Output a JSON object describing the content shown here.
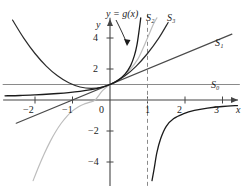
{
  "figure": {
    "name": "taylor-polynomial-approximations-graph",
    "background": "#ffffff",
    "width": 247,
    "height": 186
  },
  "axes": {
    "x_label": "x",
    "y_label": "y",
    "x_ticks": [
      {
        "value": -2,
        "label": "−2"
      },
      {
        "value": -1,
        "label": "−1"
      },
      {
        "value": 1,
        "label": "1"
      },
      {
        "value": 2,
        "label": "2"
      },
      {
        "value": 3,
        "label": "3"
      }
    ],
    "y_ticks": [
      {
        "value": 4,
        "label": "4"
      },
      {
        "value": 2,
        "label": "2"
      },
      {
        "value": -2,
        "label": "−2"
      },
      {
        "value": -4,
        "label": "−4"
      }
    ],
    "origin_label": "0",
    "xlim": [
      -2.85,
      3.55
    ],
    "ylim": [
      -5.2,
      5.3
    ],
    "axis_color": "#444444",
    "tick_color": "#444444"
  },
  "annotations": {
    "function_label": "y = g(x)",
    "function_label_color": "#1b1b1b",
    "asymptote": {
      "name": "vertical-asymptote",
      "x": 1,
      "style": "dashed",
      "color": "#8a8a8a"
    }
  },
  "chart_data": {
    "type": "line",
    "title": "",
    "xlabel": "x",
    "ylabel": "y",
    "xlim": [
      -2.85,
      3.55
    ],
    "ylim": [
      -5.2,
      5.3
    ],
    "grid": false,
    "legend": "inline-curve-labels",
    "xticks": [
      -2,
      -1,
      1,
      2,
      3
    ],
    "yticks": [
      -4,
      -2,
      2,
      4
    ],
    "series": [
      {
        "name": "g(x)",
        "label": "y = g(x)",
        "color": "#1b1b1b",
        "width": 1.3,
        "note": "function with vertical asymptote at x = 1",
        "branches": [
          {
            "side": "left",
            "points": [
              [
                -2.8,
                0.27
              ],
              [
                -2.4,
                0.29
              ],
              [
                -2.0,
                0.33
              ],
              [
                -1.7,
                0.37
              ],
              [
                -1.4,
                0.42
              ],
              [
                -1.1,
                0.48
              ],
              [
                -0.8,
                0.56
              ],
              [
                -0.5,
                0.67
              ],
              [
                -0.25,
                0.8
              ],
              [
                0.0,
                1.0
              ],
              [
                0.2,
                1.25
              ],
              [
                0.4,
                1.67
              ],
              [
                0.55,
                2.22
              ],
              [
                0.65,
                2.86
              ],
              [
                0.72,
                3.57
              ],
              [
                0.78,
                4.55
              ],
              [
                0.82,
                5.3
              ]
            ]
          },
          {
            "side": "right",
            "points": [
              [
                1.12,
                -5.2
              ],
              [
                1.18,
                -4.4
              ],
              [
                1.25,
                -3.4
              ],
              [
                1.35,
                -2.5
              ],
              [
                1.5,
                -1.7
              ],
              [
                1.7,
                -1.2
              ],
              [
                1.95,
                -0.9
              ],
              [
                2.25,
                -0.67
              ],
              [
                2.6,
                -0.52
              ],
              [
                3.0,
                -0.42
              ],
              [
                3.4,
                -0.36
              ]
            ]
          }
        ]
      },
      {
        "name": "S0",
        "label": "S₀",
        "color": "#8a8a8a",
        "width": 1.2,
        "kind": "constant",
        "equation": "y = 1",
        "points": [
          [
            -2.85,
            1.0
          ],
          [
            3.45,
            1.0
          ]
        ]
      },
      {
        "name": "S1",
        "label": "S₁",
        "color": "#4a4a4a",
        "width": 1.2,
        "kind": "linear",
        "equation": "y = 1 + x",
        "points": [
          [
            -2.5,
            -1.5
          ],
          [
            3.25,
            4.25
          ]
        ]
      },
      {
        "name": "S2",
        "label": "S₂",
        "color": "#2b2b2b",
        "width": 1.2,
        "kind": "quadratic",
        "equation": "y = 1 + x + x^2",
        "points": [
          [
            -2.6,
            5.16
          ],
          [
            -2.3,
            3.99
          ],
          [
            -2.0,
            3.0
          ],
          [
            -1.7,
            2.19
          ],
          [
            -1.4,
            1.56
          ],
          [
            -1.1,
            1.11
          ],
          [
            -0.8,
            0.84
          ],
          [
            -0.5,
            0.75
          ],
          [
            -0.2,
            0.84
          ],
          [
            0.1,
            1.11
          ],
          [
            0.4,
            1.56
          ],
          [
            0.7,
            2.19
          ],
          [
            1.0,
            3.0
          ],
          [
            1.3,
            3.99
          ],
          [
            1.55,
            5.0
          ]
        ]
      },
      {
        "name": "S3",
        "label": "S₃",
        "color": "#bdbdbd",
        "width": 1.2,
        "kind": "cubic",
        "equation": "y = 1 + x + x^2 + x^3",
        "points": [
          [
            -2.05,
            -5.2
          ],
          [
            -1.9,
            -4.29
          ],
          [
            -1.75,
            -3.45
          ],
          [
            -1.6,
            -2.7
          ],
          [
            -1.45,
            -2.05
          ],
          [
            -1.3,
            -1.5
          ],
          [
            -1.15,
            -1.05
          ],
          [
            -1.0,
            -0.7
          ],
          [
            -0.85,
            -0.45
          ],
          [
            -0.7,
            -0.27
          ],
          [
            -0.55,
            -0.15
          ],
          [
            -0.4,
            -0.01
          ],
          [
            -0.2,
            0.6
          ],
          [
            0.0,
            1.0
          ],
          [
            0.25,
            1.33
          ],
          [
            0.5,
            1.88
          ],
          [
            0.75,
            2.67
          ],
          [
            1.0,
            4.0
          ],
          [
            1.15,
            4.86
          ],
          [
            1.25,
            5.3
          ]
        ]
      }
    ],
    "curve_labels": [
      {
        "text": "S₀",
        "x": 3.15,
        "y": 1.15
      },
      {
        "text": "S₁",
        "x": 3.3,
        "y": 4.35
      },
      {
        "text": "S₂",
        "x": 1.52,
        "y": 5.05
      },
      {
        "text": "S₃",
        "x": 2.1,
        "y": 5.05
      }
    ]
  }
}
